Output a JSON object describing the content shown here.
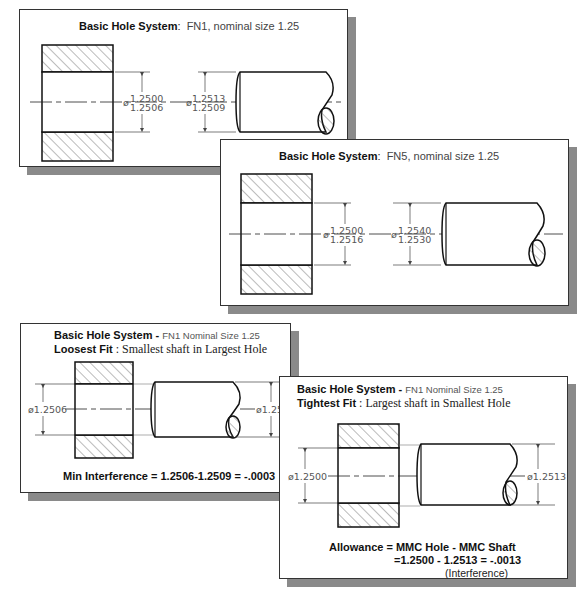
{
  "panels": [
    {
      "id": "fn1-basic",
      "title_bold": "Basic Hole System",
      "title_sep": ":",
      "title_rest": "FN1, nominal size 1.25",
      "hole_dim_upper": "1.2500",
      "hole_dim_lower": "1.2506",
      "shaft_dim_upper": "1.2513",
      "shaft_dim_lower": "1.2509",
      "diameter_symbol": "ø"
    },
    {
      "id": "fn5-basic",
      "title_bold": "Basic Hole System",
      "title_sep": ":",
      "title_rest": "FN5, nominal size 1.25",
      "hole_dim_upper": "1.2500",
      "hole_dim_lower": "1.2516",
      "shaft_dim_upper": "1.2540",
      "shaft_dim_lower": "1.2530",
      "diameter_symbol": "ø"
    },
    {
      "id": "loosest-fit",
      "title_bold": "Basic Hole System",
      "title_dash": " - ",
      "title_small": "FN1 Nominal Size 1.25",
      "fit_label": "Loosest Fit",
      "fit_desc": " : Smallest shaft in Largest Hole",
      "hole_dim": "ø1.2506",
      "shaft_dim": "ø1.2509",
      "note": "Min Interference = 1.2506-1.2509 = -.0003"
    },
    {
      "id": "tightest-fit",
      "title_bold": "Basic Hole System",
      "title_dash": " - ",
      "title_small": "FN1 Nominal Size 1.25",
      "fit_label": "Tightest Fit",
      "fit_desc": " : Largest shaft in Smallest Hole",
      "hole_dim": "ø1.2500",
      "shaft_dim": "ø1.2513",
      "note_line1": "Allowance = MMC Hole - MMC Shaft",
      "note_line2": "=1.2500 - 1.2513 = -.0013",
      "note_line3": "(Interference)"
    }
  ],
  "colors": {
    "line": "#111111",
    "hatch": "#444444",
    "shadow": "#8a8a8a",
    "dim": "#555555"
  }
}
